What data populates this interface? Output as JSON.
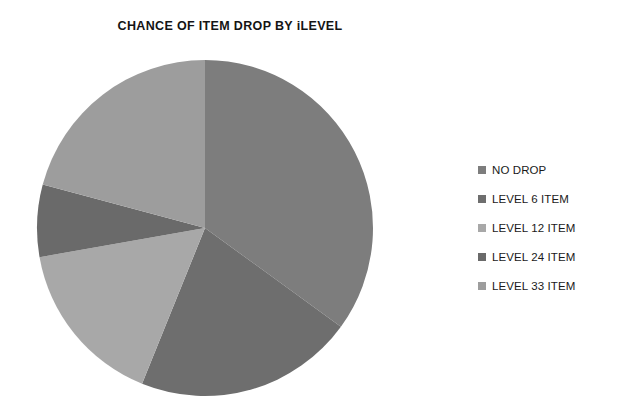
{
  "chart_data": {
    "type": "pie",
    "title": "CHANCE OF ITEM DROP BY iLEVEL",
    "xlabel": "",
    "ylabel": "",
    "legend_position": "right",
    "grid": false,
    "categories": [
      "NO DROP",
      "LEVEL 6 ITEM",
      "LEVEL 12 ITEM",
      "LEVEL 24 ITEM",
      "LEVEL 33 ITEM"
    ],
    "values": [
      35,
      21,
      16,
      7,
      21
    ],
    "slices": [
      {
        "label": "NO DROP",
        "value": 35,
        "color": "#7d7d7d",
        "start_angle": 0,
        "end_angle": 126
      },
      {
        "label": "LEVEL 6 ITEM",
        "value": 21,
        "color": "#6e6e6e",
        "start_angle": 126,
        "end_angle": 202
      },
      {
        "label": "LEVEL 12 ITEM",
        "value": 16,
        "color": "#a8a8a8",
        "start_angle": 202,
        "end_angle": 260
      },
      {
        "label": "LEVEL 24 ITEM",
        "value": 7,
        "color": "#6a6a6a",
        "start_angle": 260,
        "end_angle": 285
      },
      {
        "label": "LEVEL 33 ITEM",
        "value": 21,
        "color": "#9d9d9d",
        "start_angle": 285,
        "end_angle": 360
      }
    ],
    "geometry": {
      "center_x": 175,
      "center_y": 180,
      "radius": 168
    }
  },
  "legend": {
    "items": [
      {
        "label": "NO DROP",
        "swatch_color": "#7d7d7d",
        "swatch_icon": "square-swatch-icon"
      },
      {
        "label": "LEVEL 6 ITEM",
        "swatch_color": "#6e6e6e",
        "swatch_icon": "square-swatch-icon"
      },
      {
        "label": "LEVEL 12 ITEM",
        "swatch_color": "#a8a8a8",
        "swatch_icon": "square-swatch-icon"
      },
      {
        "label": "LEVEL 24 ITEM",
        "swatch_color": "#6a6a6a",
        "swatch_icon": "square-swatch-icon"
      },
      {
        "label": "LEVEL 33 ITEM",
        "swatch_color": "#9d9d9d",
        "swatch_icon": "square-swatch-icon"
      }
    ]
  }
}
